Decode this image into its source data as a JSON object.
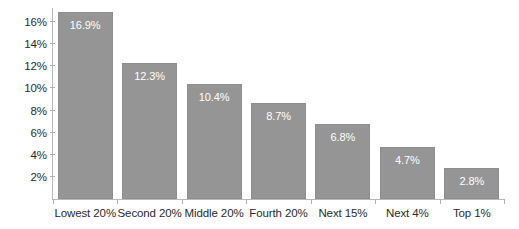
{
  "chart_data": {
    "type": "bar",
    "title": "",
    "subtitle": "",
    "xlabel": "",
    "ylabel": "",
    "categories": [
      "Lowest 20%",
      "Second 20%",
      "Middle 20%",
      "Fourth 20%",
      "Next 15%",
      "Next 4%",
      "Top 1%"
    ],
    "values": [
      16.9,
      12.3,
      10.4,
      8.7,
      6.8,
      4.7,
      2.8
    ],
    "value_labels": [
      "16.9%",
      "12.3%",
      "10.4%",
      "8.7%",
      "6.8%",
      "4.7%",
      "2.8%"
    ],
    "ylim": [
      0,
      17.3
    ],
    "yticks": [
      2,
      4,
      6,
      8,
      10,
      12,
      14,
      16
    ],
    "ytick_labels": [
      "2%",
      "4%",
      "6%",
      "8%",
      "10%",
      "12%",
      "14%",
      "16%"
    ],
    "grid": false,
    "legend": null,
    "legend_position": "none",
    "bar_color": "#959595",
    "bar_edge_color": "#8e8e8e",
    "value_label_color": "#ffffff",
    "axis_color": "#b9b9b9",
    "tick_text_color": "#2b2b2b",
    "background": "#ffffff"
  }
}
